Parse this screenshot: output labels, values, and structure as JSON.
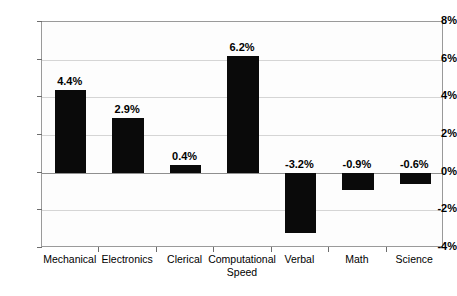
{
  "chart_data": {
    "type": "bar",
    "title": "",
    "subtitle": "",
    "xlabel": "",
    "ylabel": "",
    "categories": [
      "Mechanical",
      "Electronics",
      "Clerical",
      "Computational\nSpeed",
      "Verbal",
      "Math",
      "Science"
    ],
    "values": [
      4.4,
      2.9,
      0.4,
      6.2,
      -3.2,
      -0.9,
      -0.6
    ],
    "data_labels": [
      "4.4%",
      "2.9%",
      "0.4%",
      "6.2%",
      "-3.2%",
      "-0.9%",
      "-0.6%"
    ],
    "ylim": [
      -4,
      8
    ],
    "ytick_values": [
      8,
      6,
      4,
      2,
      0,
      -2,
      -4
    ],
    "ytick_labels": [
      "8%",
      "6%",
      "4%",
      "2%",
      "0%",
      "-2%",
      "-4%"
    ],
    "gridlines": [
      6,
      4,
      2,
      0,
      -2
    ],
    "grid": true,
    "legend": null,
    "legend_position": "none",
    "bar_color": "#0a0a0a",
    "plot_background": "#fdfdfd",
    "grid_color": "#d5d5d5",
    "axis_color": "#9a9a9a",
    "zero_line_color": "#8f8f8f",
    "annotations": []
  }
}
